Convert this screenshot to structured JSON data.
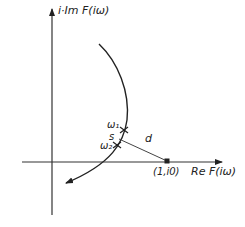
{
  "diagram": {
    "type": "nyquist-plot",
    "axes": {
      "y_label": "i·Im F(iω)",
      "x_label": "Re F(iω)"
    },
    "point": {
      "label": "(1,i0)"
    },
    "curve_markers": [
      {
        "label": "ω₁"
      },
      {
        "label": "ω₂"
      }
    ],
    "segment_labels": {
      "arc": "s",
      "distance": "d"
    },
    "colors": {
      "ink": "#222222",
      "background": "#ffffff"
    }
  }
}
